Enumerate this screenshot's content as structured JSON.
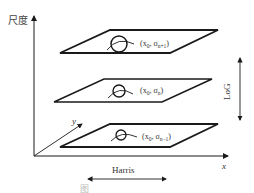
{
  "diagram": {
    "axes": {
      "vertical_label": "尺度",
      "x_label": "x",
      "y_label": "y"
    },
    "layers": [
      {
        "position": "top",
        "label_prefix": "(x",
        "x_sub": "0",
        "sep": ", σ",
        "sigma_sub": "n+1",
        "close": ")"
      },
      {
        "position": "middle",
        "label_prefix": "(x",
        "x_sub": "0",
        "sep": ", σ",
        "sigma_sub": "n",
        "close": ")"
      },
      {
        "position": "bottom",
        "label_prefix": "(x",
        "x_sub": "0",
        "sep": ", σ",
        "sigma_sub": "n−1",
        "close": ")"
      }
    ],
    "arrows": {
      "scale_arrow_label": "LoG",
      "space_arrow_label": "Harris"
    },
    "caption": "图"
  },
  "colors": {
    "stroke": "#1a1a1a",
    "text": "#333333",
    "background": "#ffffff"
  }
}
